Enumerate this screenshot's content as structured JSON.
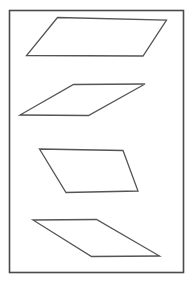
{
  "figure": {
    "canvas": {
      "width": 192,
      "height": 285,
      "background": "#ffffff"
    },
    "frame": {
      "label": "Outer rectangular border",
      "x": 9.5,
      "y": 10.5,
      "width": 174,
      "height": 262,
      "stroke": "#4a4a4a",
      "stroke_width": 1.6
    },
    "shape_style": {
      "stroke": "#555555",
      "stroke_width": 1.3
    },
    "shapes": [
      {
        "id": "parallelogram-1",
        "label": "Parallelogram 1 (top, leaning right)",
        "points": "57.5,17.5 166.5,20.0 143.0,56.0 26.5,55.5",
        "vertices": [
          {
            "name": "top-left",
            "x": 57.5,
            "y": 17.5
          },
          {
            "name": "top-right",
            "x": 166.5,
            "y": 20.0
          },
          {
            "name": "bottom-right",
            "x": 143.0,
            "y": 56.0
          },
          {
            "name": "bottom-left",
            "x": 26.5,
            "y": 55.5
          }
        ]
      },
      {
        "id": "parallelogram-2",
        "label": "Parallelogram 2 (upper middle, leaning right)",
        "points": "73.5,84.5 145.0,84.0 88.5,115.5 20.0,115.0",
        "vertices": [
          {
            "name": "top-left",
            "x": 73.5,
            "y": 84.5
          },
          {
            "name": "top-right",
            "x": 145.0,
            "y": 84.0
          },
          {
            "name": "bottom-right",
            "x": 88.5,
            "y": 115.5
          },
          {
            "name": "bottom-left",
            "x": 20.0,
            "y": 115.0
          }
        ]
      },
      {
        "id": "parallelogram-3",
        "label": "Parallelogram 3 (lower middle, leaning left)",
        "points": "39.5,149.0 123.0,150.5 138.0,191.0 66.0,192.5",
        "vertices": [
          {
            "name": "top-left",
            "x": 39.5,
            "y": 149.0
          },
          {
            "name": "top-right",
            "x": 123.0,
            "y": 150.5
          },
          {
            "name": "bottom-right",
            "x": 138.0,
            "y": 191.0
          },
          {
            "name": "bottom-left",
            "x": 66.0,
            "y": 192.5
          }
        ]
      },
      {
        "id": "parallelogram-4",
        "label": "Parallelogram 4 (bottom, leaning left)",
        "points": "33.0,220.0 96.5,219.5 159.5,256.0 91.5,256.5",
        "vertices": [
          {
            "name": "top-left",
            "x": 33.0,
            "y": 220.0
          },
          {
            "name": "top-right",
            "x": 96.5,
            "y": 219.5
          },
          {
            "name": "bottom-right",
            "x": 159.5,
            "y": 256.0
          },
          {
            "name": "bottom-left",
            "x": 91.5,
            "y": 256.5
          }
        ]
      }
    ]
  }
}
